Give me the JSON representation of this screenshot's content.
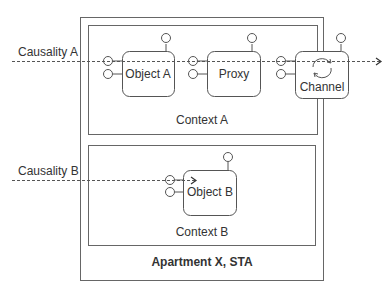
{
  "apartment": {
    "label": "Apartment X, STA"
  },
  "contexts": [
    {
      "label": "Context A"
    },
    {
      "label": "Context B"
    }
  ],
  "causalities": [
    {
      "label": "Causality A"
    },
    {
      "label": "Causality B"
    }
  ],
  "objects": {
    "object_a": "Object A",
    "proxy": "Proxy",
    "channel": "Channel",
    "object_b": "Object B"
  },
  "colors": {
    "stroke": "#555555",
    "text": "#333333",
    "background": "#ffffff"
  }
}
